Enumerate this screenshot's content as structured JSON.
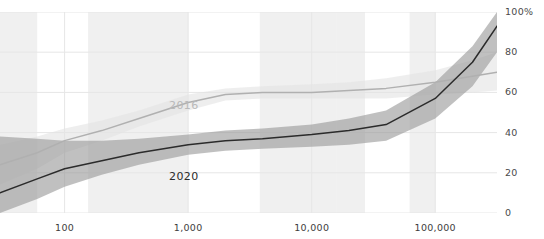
{
  "header": {
    "cropped_text": "· · ·"
  },
  "axes": {
    "y_ticks": [
      {
        "label": "100%",
        "value": 100
      },
      {
        "label": "80",
        "value": 80
      },
      {
        "label": "60",
        "value": 60
      },
      {
        "label": "40",
        "value": 40
      },
      {
        "label": "20",
        "value": 20
      },
      {
        "label": "0",
        "value": 0
      }
    ],
    "x_ticks": [
      {
        "label": "100",
        "value": 100
      },
      {
        "label": "1,000",
        "value": 1000
      },
      {
        "label": "10,000",
        "value": 10000
      },
      {
        "label": "100,000",
        "value": 100000
      }
    ]
  },
  "series_labels": {
    "s2016": "2016",
    "s2020": "2020"
  },
  "colors": {
    "line_2016": "#b0b0b0",
    "band_2016": "#e3e3e3",
    "line_2020": "#2b2b2b",
    "band_2020": "#9a9a9a",
    "grid": "#e6e6e6",
    "density_band": "#f0f0f0",
    "tick_text": "#3d3d3d"
  },
  "chart_data": {
    "type": "line",
    "title": "",
    "subtitle": "",
    "xlabel": "",
    "ylabel": "",
    "xscale": "log",
    "yscale": "linear",
    "xlim": [
      30,
      316000
    ],
    "ylim": [
      0,
      100
    ],
    "grid": true,
    "legend": "inline-labels",
    "x_tick_values": [
      100,
      1000,
      10000,
      100000
    ],
    "x_tick_labels": [
      "100",
      "1,000",
      "10,000",
      "100,000"
    ],
    "y_tick_values": [
      0,
      20,
      40,
      60,
      80,
      100
    ],
    "y_tick_labels": [
      "0",
      "20",
      "40",
      "60",
      "80",
      "100%"
    ],
    "density_bands": [
      {
        "x_start": 30,
        "x_end": 60
      },
      {
        "x_start": 155,
        "x_end": 1000
      },
      {
        "x_start": 3800,
        "x_end": 16000
      },
      {
        "x_start": 16000,
        "x_end": 27000
      },
      {
        "x_start": 62000,
        "x_end": 100000
      }
    ],
    "series": [
      {
        "name": "2016",
        "color": "#b0b0b0",
        "band_color": "#e3e3e3",
        "label_position": {
          "x": 700,
          "y": 53
        },
        "x": [
          30,
          60,
          100,
          200,
          400,
          1000,
          2000,
          4000,
          10000,
          20000,
          40000,
          100000,
          200000,
          316000
        ],
        "y": [
          24,
          30,
          36,
          41,
          47,
          55,
          59,
          60,
          60,
          61,
          62,
          65,
          68,
          70
        ],
        "y_low": [
          14,
          22,
          30,
          36,
          43,
          51,
          56,
          57,
          57,
          57,
          57,
          59,
          60,
          61
        ],
        "y_high": [
          34,
          38,
          42,
          46,
          51,
          59,
          62,
          63,
          64,
          65,
          67,
          71,
          76,
          80
        ]
      },
      {
        "name": "2020",
        "color": "#2b2b2b",
        "band_color": "#9a9a9a",
        "label_position": {
          "x": 700,
          "y": 18
        },
        "x": [
          30,
          60,
          100,
          200,
          400,
          1000,
          2000,
          4000,
          10000,
          20000,
          40000,
          100000,
          200000,
          316000
        ],
        "y": [
          10,
          17,
          22,
          26,
          30,
          34,
          36,
          37,
          39,
          41,
          44,
          57,
          75,
          93
        ],
        "y_low": [
          0,
          7,
          13,
          19,
          24,
          29,
          31,
          32,
          33,
          34,
          36,
          47,
          63,
          80
        ],
        "y_high": [
          38,
          37,
          36,
          36,
          37,
          39,
          41,
          42,
          44,
          47,
          51,
          65,
          83,
          100
        ]
      }
    ]
  }
}
